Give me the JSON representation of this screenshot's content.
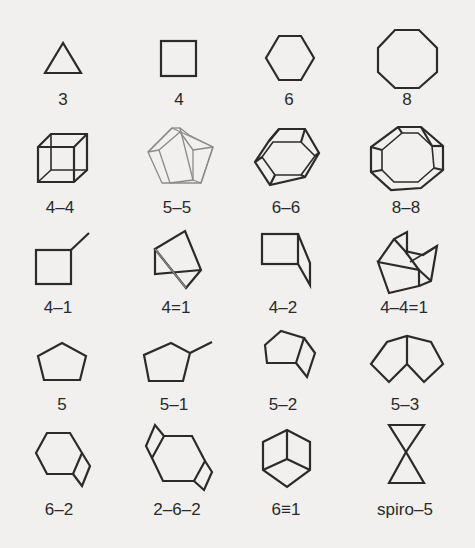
{
  "figure": {
    "background_color": "#f1f0ee",
    "line_color": "#2b2b2b",
    "rows": [
      {
        "cells": [
          {
            "label": "3",
            "shape": "triangle"
          },
          {
            "label": "4",
            "shape": "square"
          },
          {
            "label": "6",
            "shape": "hexagon"
          },
          {
            "label": "8",
            "shape": "octagon"
          }
        ]
      },
      {
        "cells": [
          {
            "label": "4–4",
            "shape": "cube-prism"
          },
          {
            "label": "5–5",
            "shape": "pentagonal-prism"
          },
          {
            "label": "6–6",
            "shape": "hexagonal-prism"
          },
          {
            "label": "8–8",
            "shape": "octagonal-prism"
          }
        ]
      },
      {
        "cells": [
          {
            "label": "4–1",
            "shape": "square-with-branch"
          },
          {
            "label": "4=1",
            "shape": "bicyclobutane-bridged"
          },
          {
            "label": "4–2",
            "shape": "fused-square-bent"
          },
          {
            "label": "4–4=1",
            "shape": "tricyclic-cage"
          }
        ]
      },
      {
        "cells": [
          {
            "label": "5",
            "shape": "pentagon"
          },
          {
            "label": "5–1",
            "shape": "pentagon-with-branch"
          },
          {
            "label": "5–2",
            "shape": "pentagon-fused-square"
          },
          {
            "label": "5–3",
            "shape": "fused-pentagons"
          }
        ]
      },
      {
        "cells": [
          {
            "label": "6–2",
            "shape": "hexagon-fused-square"
          },
          {
            "label": "2–6–2",
            "shape": "hexagon-two-squares"
          },
          {
            "label": "6≡1",
            "shape": "bicyclo-hexagon-bridged"
          },
          {
            "label": "spiro–5",
            "shape": "spiro-triangles"
          }
        ]
      }
    ]
  }
}
